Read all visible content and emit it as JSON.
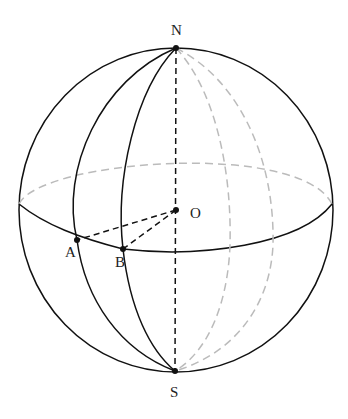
{
  "figure": {
    "type": "sphere-geometry",
    "labels": {
      "north": "N",
      "south": "S",
      "center": "O",
      "point_a": "A",
      "point_b": "B"
    },
    "points": {
      "N": [
        176,
        48
      ],
      "S": [
        175,
        371
      ],
      "O": [
        176,
        210
      ],
      "A": [
        77,
        240
      ],
      "B": [
        123,
        249
      ]
    },
    "colors": {
      "visible_line": "#111111",
      "hidden_line": "#bbbbbb",
      "point": "#111111"
    }
  }
}
